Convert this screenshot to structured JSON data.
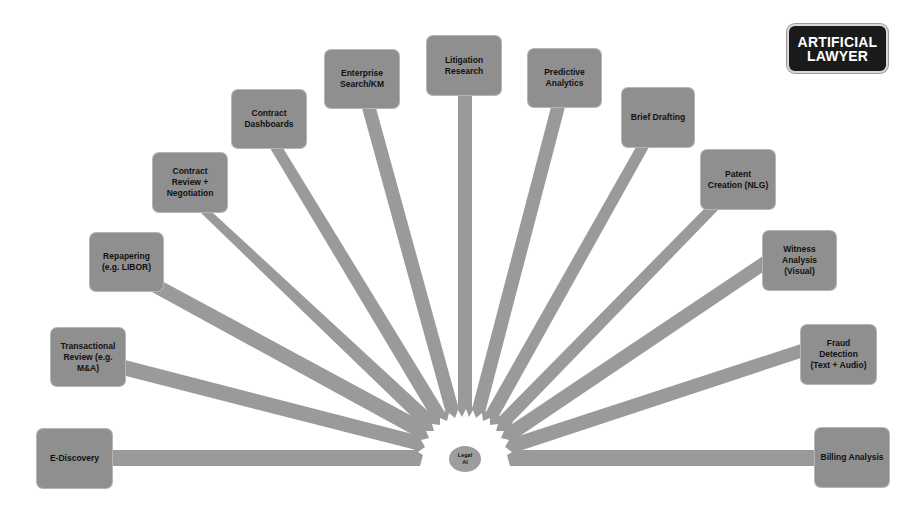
{
  "logo": {
    "line1": "ARTIFICIAL",
    "line2": "LAWYER"
  },
  "center": {
    "label": "Legal\nAI"
  },
  "colors": {
    "spoke": "#9a9a9a",
    "node": "#8f8f8f",
    "text": "#111111",
    "background": "#ffffff",
    "logo_bg": "#1a1a1a"
  },
  "nodes": [
    {
      "label": "E-Discovery"
    },
    {
      "label": "Transactional\nReview (e.g.\nM&A)"
    },
    {
      "label": "Repapering\n(e.g. LIBOR)"
    },
    {
      "label": "Contract\nReview +\nNegotiation"
    },
    {
      "label": "Contract\nDashboards"
    },
    {
      "label": "Enterprise\nSearch/KM"
    },
    {
      "label": "Litigation\nResearch"
    },
    {
      "label": "Predictive\nAnalytics"
    },
    {
      "label": "Brief Drafting"
    },
    {
      "label": "Patent\nCreation (NLG)"
    },
    {
      "label": "Witness\nAnalysis\n(Visual)"
    },
    {
      "label": "Fraud\nDetection\n(Text + Audio)"
    },
    {
      "label": "Billing Analysis"
    }
  ]
}
